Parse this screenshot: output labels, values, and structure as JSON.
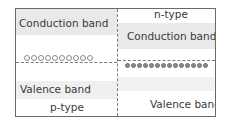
{
  "diagram": {
    "left_region": {
      "type_label": "p-type",
      "conduction_label": "Conduction band",
      "valence_label": "Valence band",
      "carrier": "holes",
      "carrier_count": 10
    },
    "right_region": {
      "type_label": "n-type",
      "conduction_label": "Conduction band",
      "valence_label": "Valence band",
      "carrier": "electrons",
      "carrier_count": 14
    },
    "colors": {
      "border": "#6a6a6a",
      "band_shade": "#e9e9e9",
      "dashed_line": "#7a7a7a",
      "text": "#3a3a3a"
    }
  }
}
